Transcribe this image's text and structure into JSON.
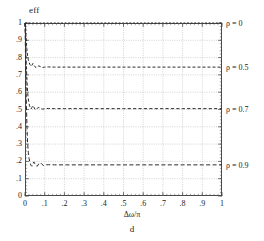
{
  "chart_data": {
    "type": "line",
    "title": "",
    "ylabel": "eff",
    "xlabel": "Δω/π",
    "caption": "d",
    "xlim": [
      0,
      1
    ],
    "ylim": [
      0,
      1
    ],
    "grid": true,
    "legend_position": "right-outside",
    "xticks": [
      0,
      0.1,
      0.2,
      0.3,
      0.4,
      0.5,
      0.6,
      0.7,
      0.8,
      0.9,
      1
    ],
    "xticklabels": [
      "0",
      ".1",
      ".2",
      ".3",
      ".4",
      ".5",
      ".6",
      ".7",
      ".8",
      ".9",
      "1"
    ],
    "yticks": [
      0,
      0.1,
      0.2,
      0.3,
      0.4,
      0.5,
      0.6,
      0.7,
      0.8,
      0.9,
      1
    ],
    "yticklabels": [
      "0",
      ".1",
      ".2",
      ".3",
      ".4",
      ".5",
      ".6",
      ".7",
      ".8",
      ".9",
      "1"
    ],
    "series": [
      {
        "name": "rho = 0",
        "legend_label": "ρ = 0",
        "legend_y": 1.0,
        "plateau": 1.0,
        "color": "#2b2b2b",
        "dash": "2,1.6",
        "x": [
          0,
          0.004,
          0.008,
          0.012,
          0.016,
          0.02,
          0.025,
          0.03,
          0.04,
          0.05,
          0.06,
          0.08,
          0.1,
          0.15,
          0.2,
          0.3,
          0.4,
          0.5,
          0.6,
          0.7,
          0.8,
          0.9,
          1
        ],
        "y": [
          1.0,
          1.0,
          1.0,
          1.0,
          1.0,
          1.0,
          1.0,
          1.0,
          1.0,
          1.0,
          1.0,
          1.0,
          1.0,
          1.0,
          1.0,
          1.0,
          1.0,
          1.0,
          1.0,
          1.0,
          1.0,
          1.0,
          1.0
        ]
      },
      {
        "name": "rho = 0.5",
        "legend_label": "ρ = 0.5",
        "legend_y": 0.745,
        "plateau": 0.745,
        "color": "#2b2b2b",
        "dash": "3,2",
        "x": [
          0,
          0.002,
          0.004,
          0.006,
          0.008,
          0.011,
          0.014,
          0.017,
          0.02,
          0.024,
          0.028,
          0.032,
          0.036,
          0.04,
          0.045,
          0.05,
          0.056,
          0.062,
          0.07,
          0.08,
          0.09,
          0.1,
          0.12,
          0.15,
          0.2,
          0.3,
          0.4,
          0.5,
          0.6,
          0.7,
          0.8,
          0.9,
          1
        ],
        "y": [
          1.0,
          0.985,
          0.955,
          0.91,
          0.868,
          0.83,
          0.805,
          0.787,
          0.775,
          0.762,
          0.754,
          0.75,
          0.757,
          0.766,
          0.758,
          0.748,
          0.742,
          0.748,
          0.752,
          0.747,
          0.743,
          0.745,
          0.746,
          0.745,
          0.745,
          0.745,
          0.745,
          0.745,
          0.745,
          0.745,
          0.745,
          0.745,
          0.745
        ]
      },
      {
        "name": "rho = 0.7",
        "legend_label": "ρ = 0.7",
        "legend_y": 0.505,
        "plateau": 0.505,
        "color": "#2b2b2b",
        "dash": "3.2,2.2",
        "x": [
          0,
          0.002,
          0.004,
          0.006,
          0.009,
          0.012,
          0.015,
          0.019,
          0.023,
          0.027,
          0.031,
          0.035,
          0.04,
          0.045,
          0.05,
          0.056,
          0.062,
          0.07,
          0.08,
          0.09,
          0.1,
          0.12,
          0.15,
          0.2,
          0.3,
          0.4,
          0.5,
          0.6,
          0.7,
          0.8,
          0.9,
          1
        ],
        "y": [
          1.0,
          0.94,
          0.86,
          0.775,
          0.69,
          0.625,
          0.578,
          0.545,
          0.522,
          0.51,
          0.503,
          0.512,
          0.523,
          0.514,
          0.503,
          0.498,
          0.507,
          0.512,
          0.506,
          0.502,
          0.505,
          0.506,
          0.505,
          0.505,
          0.505,
          0.505,
          0.505,
          0.505,
          0.505,
          0.505,
          0.505,
          0.505
        ]
      },
      {
        "name": "rho = 0.9",
        "legend_label": "ρ = 0.9",
        "legend_y": 0.18,
        "plateau": 0.18,
        "color": "#2b2b2b",
        "dash": "4,2.4",
        "x": [
          0,
          0.002,
          0.004,
          0.007,
          0.01,
          0.013,
          0.017,
          0.021,
          0.025,
          0.03,
          0.035,
          0.04,
          0.045,
          0.05,
          0.056,
          0.062,
          0.07,
          0.078,
          0.086,
          0.095,
          0.105,
          0.12,
          0.15,
          0.2,
          0.3,
          0.4,
          0.5,
          0.6,
          0.7,
          0.8,
          0.9,
          1
        ],
        "y": [
          1.0,
          0.86,
          0.7,
          0.53,
          0.4,
          0.31,
          0.25,
          0.215,
          0.193,
          0.178,
          0.172,
          0.186,
          0.197,
          0.186,
          0.175,
          0.172,
          0.186,
          0.193,
          0.183,
          0.176,
          0.18,
          0.181,
          0.18,
          0.18,
          0.18,
          0.18,
          0.18,
          0.18,
          0.18,
          0.18,
          0.18,
          0.18
        ]
      }
    ]
  },
  "colors": {
    "curve": "#2b2b2b",
    "grid": "#b6b6b6",
    "frame": "#4a4a4a",
    "text": "#1b1b1b",
    "background": "#ffffff"
  }
}
